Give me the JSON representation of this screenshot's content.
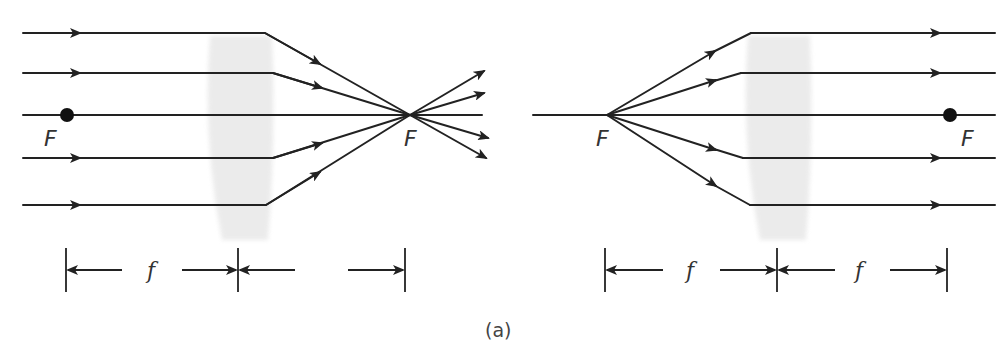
{
  "figure": {
    "caption": "(a)",
    "colors": {
      "ray": "#222222",
      "lens": "#e9e9e9",
      "text": "#333333"
    }
  },
  "left_panel": {
    "description": "Converging lens: parallel rays converge to the focal point F",
    "focal_label_near": "F",
    "focal_label_far": "F",
    "dimension_labels": [
      "f",
      ""
    ]
  },
  "right_panel": {
    "description": "Rays diverging from focal point F emerge parallel after the lens",
    "focal_label_near": "F",
    "focal_label_far": "F",
    "dimension_labels": [
      "f",
      "f"
    ]
  }
}
